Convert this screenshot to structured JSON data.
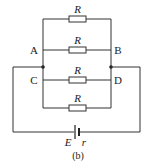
{
  "diagram": {
    "caption": "(b)",
    "nodes": {
      "A": "A",
      "B": "B",
      "C": "C",
      "D": "D"
    },
    "resistors": [
      {
        "label": "R"
      },
      {
        "label": "R"
      },
      {
        "label": "R"
      },
      {
        "label": "R"
      }
    ],
    "battery": {
      "emf_label": "E",
      "internal_resistance_label": "r"
    },
    "colors": {
      "wire": "#333333",
      "background": "#ffffff"
    }
  }
}
